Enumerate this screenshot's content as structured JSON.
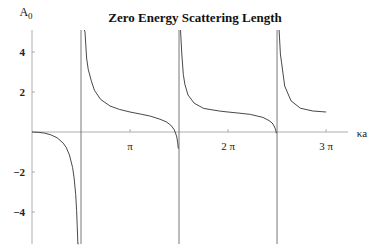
{
  "chart_data": {
    "type": "line",
    "title": "Zero Energy Scattering Length",
    "xlabel": "κa",
    "ylabel": "A₀",
    "xlim": [
      0,
      9.6
    ],
    "ylim": [
      -5.5,
      5.2
    ],
    "grid": false,
    "legend": null,
    "x_ticks": [
      {
        "value": 3.14159,
        "label": "π"
      },
      {
        "value": 6.28319,
        "label": "2 π"
      },
      {
        "value": 9.42478,
        "label": "3 π"
      }
    ],
    "y_ticks": [
      {
        "value": 4,
        "label": "4"
      },
      {
        "value": 2,
        "label": "2"
      },
      {
        "value": -2,
        "label": "-2"
      },
      {
        "value": -4,
        "label": "-4"
      }
    ],
    "asymptotes_x": [
      1.5708,
      4.7124,
      7.854
    ],
    "note": "Sampled from A0 = 1 - tan(κa)/κa, fitted to the plotted curve; branches separated at asymptotes",
    "series": [
      {
        "name": "branch-1",
        "x": [
          0.001,
          0.2,
          0.4,
          0.6,
          0.8,
          1.0,
          1.1,
          1.2,
          1.3,
          1.35,
          1.4,
          1.43,
          1.45,
          1.47,
          1.49,
          1.5
        ],
        "y": [
          0,
          -0.014,
          -0.057,
          -0.14,
          -0.286,
          -0.557,
          -0.781,
          -1.143,
          -1.773,
          -2.29,
          -3.131,
          -3.925,
          -4.663,
          -5.6,
          -6.9,
          -8.0
        ]
      },
      {
        "name": "branch-2",
        "x": [
          1.66,
          1.68,
          1.7,
          1.75,
          1.8,
          1.9,
          2.0,
          2.2,
          2.5,
          2.8,
          3.14159,
          3.5,
          3.8,
          4.1,
          4.3,
          4.45,
          4.55,
          4.6,
          4.64,
          4.67,
          4.69
        ],
        "y": [
          7.7,
          6.1,
          5.0,
          3.7,
          3.14,
          2.56,
          2.09,
          1.63,
          1.3,
          1.13,
          1.0,
          0.89,
          0.79,
          0.64,
          0.51,
          0.34,
          0.13,
          -0.05,
          -0.25,
          -0.54,
          -0.83
        ]
      },
      {
        "name": "branch-3",
        "x": [
          4.7,
          4.705,
          4.74,
          4.76,
          4.8,
          4.85,
          4.9,
          5.0,
          5.2,
          5.5,
          6.0,
          6.28319,
          6.6,
          7.0,
          7.4,
          7.6,
          7.7,
          7.76,
          7.8,
          7.82,
          7.83
        ],
        "y": [
          -16,
          -31,
          8.7,
          5.4,
          3.9,
          2.88,
          2.38,
          1.85,
          1.44,
          1.18,
          1.05,
          1.0,
          0.95,
          0.88,
          0.73,
          0.57,
          0.45,
          0.3,
          0.14,
          0.03,
          -0.06
        ]
      },
      {
        "name": "branch-4",
        "x": [
          7.835,
          7.84,
          7.845,
          7.85
        ],
        "y": [
          -5.8,
          -8.5,
          -14,
          -36
        ]
      },
      {
        "name": "branch-5",
        "x": [
          7.86,
          7.87,
          7.89,
          7.92,
          7.96,
          8.0,
          8.1,
          8.3,
          8.6,
          9.0,
          9.42478
        ],
        "y": [
          32,
          17,
          8.0,
          5.9,
          3.9,
          3.46,
          2.3,
          1.56,
          1.19,
          1.05,
          1.0
        ]
      }
    ]
  }
}
